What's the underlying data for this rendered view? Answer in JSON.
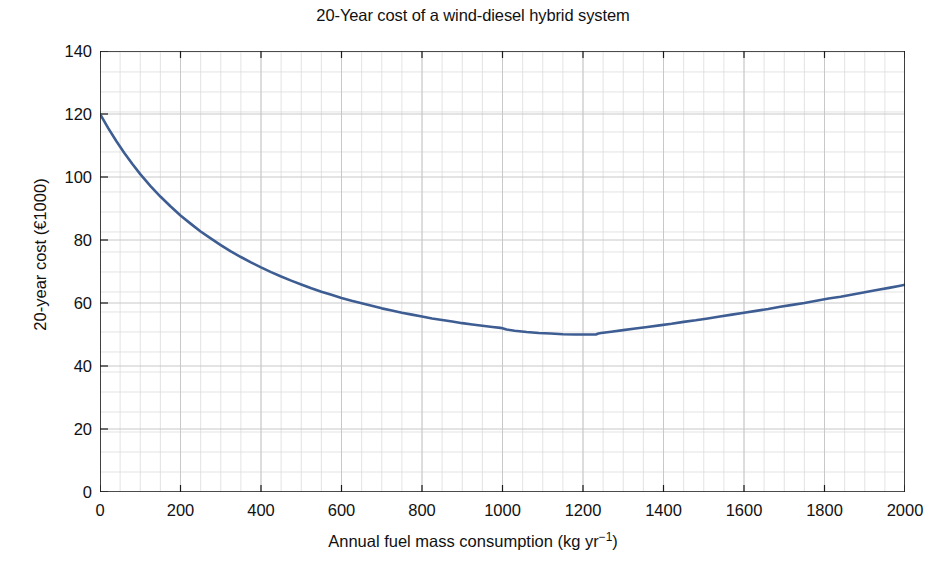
{
  "chart_data": {
    "type": "line",
    "title": "20-Year cost of a wind-diesel hybrid system",
    "xlabel": "Annual fuel mass consumption (kg yr−1)",
    "xlabel_base": "Annual fuel mass consumption (kg yr",
    "xlabel_sup": "−1",
    "xlabel_tail": ")",
    "ylabel": "20-year cost (€1000)",
    "xlim": [
      0,
      2000
    ],
    "ylim": [
      0,
      140
    ],
    "xticks": [
      0,
      200,
      400,
      600,
      800,
      1000,
      1200,
      1400,
      1600,
      1800,
      2000
    ],
    "yticks": [
      0,
      20,
      40,
      60,
      80,
      100,
      120,
      140
    ],
    "xtick_labels": [
      "0",
      "200",
      "400",
      "600",
      "800",
      "1000",
      "1200",
      "1400",
      "1600",
      "1800",
      "2000"
    ],
    "ytick_labels": [
      "0",
      "20",
      "40",
      "60",
      "80",
      "100",
      "120",
      "140"
    ],
    "x_minor_step": 50,
    "y_minor_step": 6.35,
    "grid": true,
    "grid_color": "#c8c8c8",
    "grid_minor_color": "#dcdcdc",
    "axis_color": "#1a1a1a",
    "background": "#ffffff",
    "legend": null,
    "series": [
      {
        "name": "20-year cost",
        "color": "#3e5d93",
        "line_width": 2.6,
        "x": [
          0,
          25,
          50,
          75,
          100,
          125,
          150,
          175,
          200,
          225,
          250,
          275,
          300,
          325,
          350,
          375,
          400,
          425,
          450,
          475,
          500,
          525,
          550,
          575,
          600,
          625,
          650,
          675,
          700,
          725,
          750,
          775,
          800,
          825,
          850,
          875,
          900,
          925,
          950,
          975,
          1000,
          1010,
          1025,
          1050,
          1075,
          1100,
          1125,
          1150,
          1175,
          1200,
          1225,
          1235,
          1250,
          1275,
          1300,
          1325,
          1350,
          1375,
          1400,
          1425,
          1450,
          1475,
          1500,
          1525,
          1550,
          1575,
          1600,
          1625,
          1650,
          1675,
          1700,
          1725,
          1750,
          1775,
          1800,
          1825,
          1850,
          1875,
          1900,
          1925,
          1950,
          1975,
          2000
        ],
        "y": [
          120.0,
          114.4,
          109.3,
          104.6,
          100.3,
          96.3,
          92.7,
          89.3,
          86.2,
          83.4,
          80.8,
          78.4,
          76.2,
          74.2,
          72.3,
          70.6,
          69.0,
          67.5,
          66.2,
          64.9,
          63.8,
          62.7,
          61.7,
          60.8,
          59.9,
          59.1,
          58.4,
          57.7,
          57.1,
          56.5,
          55.9,
          55.4,
          54.9,
          54.4,
          54.0,
          53.6,
          53.2,
          52.9,
          52.6,
          52.3,
          52.0,
          51.8,
          51.5,
          51.1,
          50.8,
          50.6,
          50.4,
          50.2,
          50.1,
          50.0,
          50.0,
          50.2,
          50.5,
          50.9,
          51.3,
          51.8,
          52.3,
          52.8,
          53.3,
          53.8,
          54.4,
          54.9,
          55.5,
          56.1,
          56.7,
          57.3,
          57.9,
          58.5,
          59.1,
          59.8,
          60.4,
          61.0,
          61.7,
          62.3,
          63.0,
          63.6,
          64.3,
          65.0,
          65.6,
          66.3,
          67.0,
          67.7,
          68.4
        ],
        "y_display": [
          120.0,
          114.4,
          109.3,
          104.6,
          100.3,
          96.3,
          92.7,
          89.3,
          86.2,
          83.4,
          80.8,
          78.4,
          76.2,
          74.2,
          72.3,
          70.6,
          69.0,
          67.5,
          66.2,
          64.9,
          63.8,
          62.7,
          61.7,
          60.8,
          59.9,
          59.1,
          58.4,
          57.7,
          57.1,
          56.5,
          55.9,
          55.4,
          54.9,
          54.4,
          54.0,
          53.6,
          53.2,
          52.9,
          52.6,
          52.3,
          52.0,
          51.8,
          51.5,
          51.1,
          50.8,
          50.6,
          50.4,
          50.2,
          50.1,
          50.0,
          50.0,
          50.2,
          50.5,
          50.9,
          51.3,
          51.8,
          52.3,
          52.8,
          53.3,
          53.8,
          54.4,
          54.9,
          55.5,
          56.1,
          56.7,
          57.3,
          57.9,
          58.5,
          59.1,
          59.8,
          60.4,
          61.0,
          61.7,
          62.3,
          63.0,
          63.6,
          64.3,
          65.0,
          65.6,
          66.3,
          67.0,
          67.7,
          68.4
        ]
      }
    ],
    "annotations": []
  },
  "curve_points": {
    "x": [
      0,
      20,
      40,
      60,
      80,
      100,
      125,
      150,
      175,
      200,
      225,
      250,
      275,
      300,
      325,
      350,
      375,
      400,
      425,
      450,
      475,
      500,
      525,
      550,
      575,
      600,
      625,
      650,
      675,
      700,
      725,
      750,
      775,
      800,
      825,
      850,
      875,
      900,
      925,
      950,
      975,
      995,
      1000,
      1010,
      1030,
      1060,
      1090,
      1120,
      1150,
      1180,
      1210,
      1232,
      1238,
      1245,
      1270,
      1300,
      1330,
      1360,
      1390,
      1420,
      1450,
      1480,
      1510,
      1540,
      1570,
      1600,
      1630,
      1660,
      1690,
      1720,
      1750,
      1780,
      1810,
      1840,
      1870,
      1900,
      1930,
      1960,
      1985,
      2000
    ],
    "y": [
      120.0,
      115.6,
      111.5,
      107.7,
      104.2,
      100.9,
      97.2,
      93.8,
      90.7,
      87.8,
      85.2,
      82.7,
      80.5,
      78.4,
      76.4,
      74.6,
      72.9,
      71.3,
      69.8,
      68.4,
      67.1,
      65.9,
      64.7,
      63.6,
      62.6,
      61.6,
      60.7,
      59.9,
      59.1,
      58.3,
      57.6,
      56.9,
      56.3,
      55.7,
      55.1,
      54.6,
      54.1,
      53.6,
      53.2,
      52.8,
      52.4,
      52.1,
      52.0,
      51.6,
      51.2,
      50.8,
      50.5,
      50.3,
      50.1,
      50.0,
      50.0,
      50.0,
      50.3,
      50.5,
      50.9,
      51.4,
      51.9,
      52.4,
      52.9,
      53.4,
      54.0,
      54.5,
      55.1,
      55.7,
      56.3,
      56.9,
      57.5,
      58.1,
      58.8,
      59.4,
      60.0,
      60.7,
      61.4,
      62.0,
      62.7,
      63.4,
      64.1,
      64.8,
      65.4,
      65.8
    ]
  },
  "figure": {
    "title": "20-Year cost of a wind-diesel hybrid system",
    "xlabel_base": "Annual fuel mass consumption (kg yr",
    "xlabel_sup": "−1",
    "xlabel_tail": ")",
    "ylabel": "20-year cost (€1000)"
  }
}
